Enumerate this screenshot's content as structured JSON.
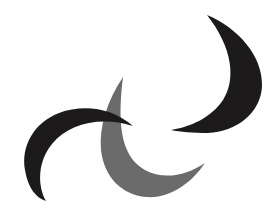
{
  "canvas": {
    "width": 270,
    "height": 222,
    "background_color": "#ffffff",
    "title": "Three overlapping crescent moon shapes"
  },
  "palette": {
    "black": "#1c1a1a",
    "gray": "#6b6b6b",
    "white": "#ffffff"
  },
  "shapes": [
    {
      "id": "crescent-top-right",
      "name": "Upper-right black crescent",
      "color": "#1c1a1a",
      "opening_direction": "lower-left",
      "bounds": {
        "x": 170,
        "y": 13,
        "width": 93,
        "height": 122
      },
      "tips": [
        {
          "label": "upper-tip",
          "x": 207,
          "y": 15
        },
        {
          "label": "lower-tip",
          "x": 171,
          "y": 131
        }
      ],
      "z_order": 1,
      "outer_path": "M 207 15 C 238 28 263 56 262 86 C 261 113 236 132 208 133 C 193 133 180 132 171 130 C 190 127 211 118 223 100 C 236 80 233 48 207 15 Z"
    },
    {
      "id": "crescent-center-gray",
      "name": "Center gray crescent",
      "color": "#6b6b6b",
      "opening_direction": "upper-right",
      "bounds": {
        "x": 99,
        "y": 76,
        "width": 108,
        "height": 122
      },
      "tips": [
        {
          "label": "upper-tip",
          "x": 123,
          "y": 77
        },
        {
          "label": "right-tip",
          "x": 205,
          "y": 163
        }
      ],
      "z_order": 2,
      "outer_path": "M 123 77 C 107 101 99 127 101 150 C 104 177 122 195 146 197 C 171 199 192 182 205 163 C 186 176 163 180 145 170 C 124 158 116 132 123 77 Z"
    },
    {
      "id": "crescent-bottom-left",
      "name": "Lower-left black crescent",
      "color": "#1c1a1a",
      "opening_direction": "lower-right",
      "bounds": {
        "x": 21,
        "y": 106,
        "width": 113,
        "height": 96
      },
      "tips": [
        {
          "label": "right-tip",
          "x": 133,
          "y": 126
        },
        {
          "label": "lower-tip",
          "x": 46,
          "y": 201
        }
      ],
      "z_order": 3,
      "outer_path": "M 133 126 C 112 108 84 104 59 113 C 33 123 21 147 25 170 C 28 188 36 198 46 201 C 37 185 38 161 52 144 C 69 123 101 116 133 126 Z"
    }
  ],
  "meta": {
    "shape_count": 3,
    "black_shape_count": 2,
    "gray_shape_count": 1
  }
}
